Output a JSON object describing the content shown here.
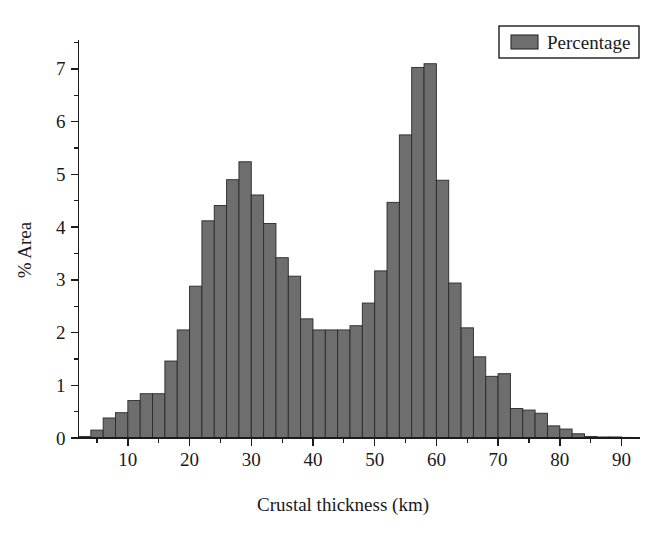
{
  "figure": {
    "legend": {
      "label": "Percentage",
      "swatch_color": "#6e6e6e",
      "position": "top-right"
    },
    "axes": {
      "x_title": "Crustal thickness (km)",
      "y_title": "% Area",
      "x_ticks": [
        "10",
        "20",
        "30",
        "40",
        "50",
        "60",
        "70",
        "80",
        "90"
      ],
      "y_ticks": [
        "0",
        "1",
        "2",
        "3",
        "4",
        "5",
        "6",
        "7"
      ]
    },
    "colors": {
      "bar_fill": "#6e6e6e",
      "bar_stroke": "#2a2a2a",
      "axis": "#1c1c1c",
      "text": "#1a1a1a",
      "background": "#ffffff"
    }
  },
  "chart_data": {
    "type": "bar",
    "title": "",
    "subtitle": "",
    "xlabel": "Crustal thickness (km)",
    "ylabel": "% Area",
    "xlim": [
      2,
      93
    ],
    "ylim": [
      0,
      7.55
    ],
    "grid": false,
    "legend": [
      "Percentage"
    ],
    "legend_position": "top-right",
    "bin_width": 2,
    "x_tick_values": [
      10,
      20,
      30,
      40,
      50,
      60,
      70,
      80,
      90
    ],
    "y_tick_values": [
      0,
      1,
      2,
      3,
      4,
      5,
      6,
      7
    ],
    "x_minor_tick_step": 5,
    "y_minor_tick_step": 0.5,
    "categories": [
      3,
      5,
      7,
      9,
      11,
      13,
      15,
      17,
      19,
      21,
      23,
      25,
      27,
      29,
      31,
      33,
      35,
      37,
      39,
      41,
      43,
      45,
      47,
      49,
      51,
      53,
      55,
      57,
      59,
      61,
      63,
      65,
      67,
      69,
      71,
      73,
      75,
      77,
      79,
      81,
      83,
      85,
      87,
      89,
      91
    ],
    "series": [
      {
        "name": "Percentage",
        "color": "#6e6e6e",
        "values": [
          0.03,
          0.15,
          0.38,
          0.48,
          0.71,
          0.84,
          0.84,
          1.46,
          2.05,
          2.88,
          4.12,
          4.41,
          4.9,
          5.24,
          4.61,
          4.07,
          3.42,
          3.07,
          2.26,
          2.05,
          2.05,
          2.05,
          2.13,
          2.56,
          3.17,
          4.47,
          5.75,
          7.03,
          7.1,
          4.89,
          2.94,
          2.09,
          1.54,
          1.17,
          1.22,
          0.56,
          0.53,
          0.47,
          0.23,
          0.17,
          0.08,
          0.03,
          0.02,
          0.02,
          0.01
        ]
      }
    ]
  }
}
